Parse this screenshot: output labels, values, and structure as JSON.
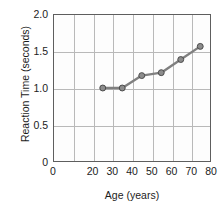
{
  "chart_data": {
    "type": "line",
    "title": "",
    "xlabel": "Age (years)",
    "ylabel": "Reaction Time (seconds)",
    "x": [
      25,
      35,
      45,
      55,
      65,
      75
    ],
    "values": [
      1.0,
      1.0,
      1.17,
      1.21,
      1.39,
      1.57
    ],
    "series": [
      {
        "name": "Reaction Time",
        "values": [
          1.0,
          1.0,
          1.17,
          1.21,
          1.39,
          1.57
        ]
      }
    ],
    "xlim": [
      0,
      80
    ],
    "ylim": [
      0,
      2.0
    ],
    "xticks": [
      0,
      20,
      30,
      40,
      50,
      60,
      70,
      80
    ],
    "xtick_labels": [
      "0",
      "20",
      "30",
      "40",
      "50",
      "60",
      "70",
      "80"
    ],
    "yticks": [
      0,
      0.5,
      1.0,
      1.5,
      2.0
    ],
    "ytick_labels": [
      "0",
      "0.5",
      "1.0",
      "1.5",
      "2.0"
    ],
    "grid": true,
    "legend": false,
    "legend_position": "none",
    "colors": {
      "line": "#808080",
      "marker_fill": "#8c8c8c",
      "marker_edge": "#4a4a4a",
      "grid": "#b9b9b9",
      "frame": "#5e5e5e",
      "plot_background": "#fdfdfd",
      "figure_background": "#ffffff",
      "text": "#1c1c1c"
    }
  }
}
